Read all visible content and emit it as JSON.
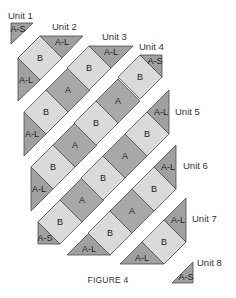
{
  "figure": {
    "caption": "FIGURE 4",
    "colors": {
      "A": "#a8a8a8",
      "B": "#dadada",
      "triangle": "#a0a0a0",
      "outline": "#4a4a4a",
      "background": "#ffffff"
    }
  },
  "units": [
    {
      "name": "Unit 1",
      "pieces": [
        "A-S"
      ]
    },
    {
      "name": "Unit 2",
      "pieces": [
        "A-L",
        "B",
        "A-L"
      ]
    },
    {
      "name": "Unit 3",
      "pieces": [
        "A-L",
        "B",
        "A",
        "B",
        "A-L"
      ]
    },
    {
      "name": "Unit 4",
      "pieces": [
        "A-L",
        "B",
        "A",
        "B",
        "A",
        "B",
        "A-S"
      ]
    },
    {
      "name": "Unit 5",
      "pieces": [
        "A-S",
        "B",
        "A",
        "B",
        "A",
        "B",
        "A-L"
      ]
    },
    {
      "name": "Unit 6",
      "pieces": [
        "A-L",
        "B",
        "A",
        "B",
        "A-L"
      ]
    },
    {
      "name": "Unit 7",
      "pieces": [
        "A-L",
        "B",
        "A-L"
      ]
    },
    {
      "name": "Unit 8",
      "pieces": [
        "A-S"
      ]
    }
  ],
  "labels": {
    "A": "A",
    "B": "B",
    "AL": "A-L",
    "AS": "A-S"
  }
}
